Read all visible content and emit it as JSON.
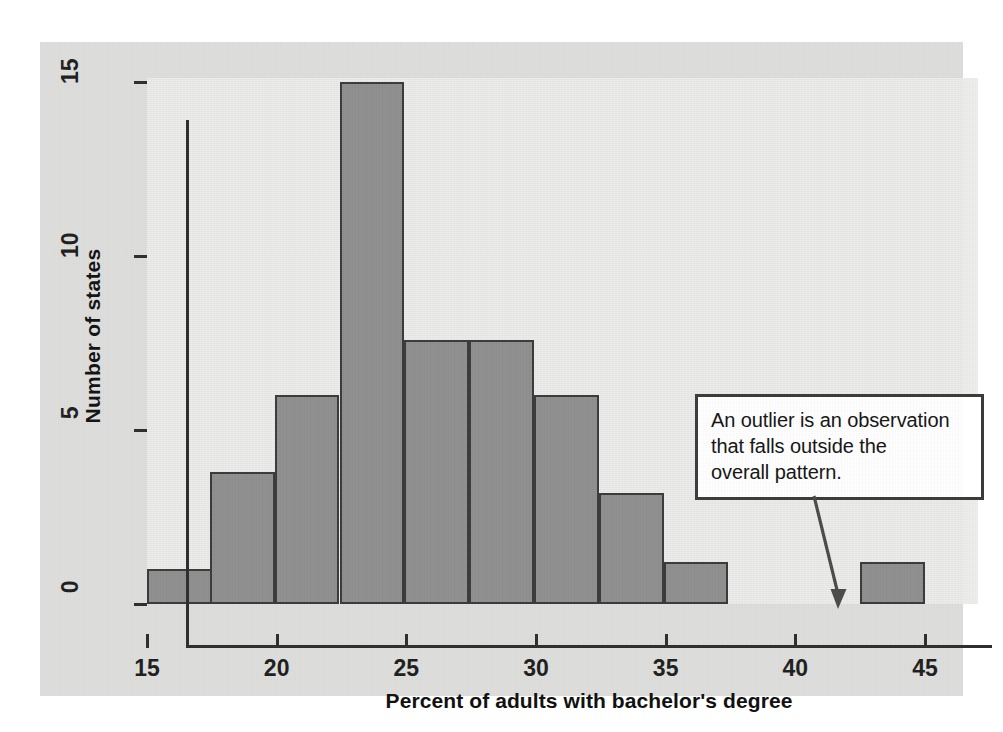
{
  "figure": {
    "panel_bg": "#dededc",
    "plot_bg": "#ededeb",
    "bar_fill": "#8f8f8f",
    "bar_stroke": "#3a3a3a",
    "axis_color": "#2e2e2e"
  },
  "annotation": {
    "line1": "An outlier is an observation",
    "line2": "that falls outside the",
    "line3": "overall pattern.",
    "full_text": "An outlier is an observation that falls outside the overall pattern."
  },
  "chart_data": {
    "type": "bar",
    "title": "",
    "xlabel": "Percent of adults with bachelor's degree",
    "ylabel": "Number of states",
    "xlim": [
      15,
      46.5
    ],
    "ylim": [
      0,
      15
    ],
    "grid": false,
    "legend": null,
    "bin_width": 2.5,
    "x_ticks": [
      15,
      20,
      25,
      30,
      35,
      40,
      45
    ],
    "x_tick_labels": [
      "15",
      "20",
      "25",
      "30",
      "35",
      "40",
      "45"
    ],
    "y_ticks": [
      0,
      5,
      10,
      15
    ],
    "y_tick_labels": [
      "0",
      "5",
      "10",
      "15"
    ],
    "bins": [
      {
        "start": 15.0,
        "end": 17.5,
        "value": 1
      },
      {
        "start": 17.5,
        "end": 20.0,
        "value": 3.8
      },
      {
        "start": 20.0,
        "end": 22.5,
        "value": 6
      },
      {
        "start": 22.5,
        "end": 25.0,
        "value": 15
      },
      {
        "start": 25.0,
        "end": 27.5,
        "value": 7.6
      },
      {
        "start": 27.5,
        "end": 30.0,
        "value": 7.6
      },
      {
        "start": 30.0,
        "end": 32.5,
        "value": 6
      },
      {
        "start": 32.5,
        "end": 35.0,
        "value": 3.2
      },
      {
        "start": 35.0,
        "end": 37.5,
        "value": 1.2
      },
      {
        "start": 37.5,
        "end": 40.0,
        "value": 0
      },
      {
        "start": 40.0,
        "end": 42.5,
        "value": 0
      },
      {
        "start": 42.5,
        "end": 45.0,
        "value": 1.2
      }
    ],
    "categories": [
      "15-17.5",
      "17.5-20",
      "20-22.5",
      "22.5-25",
      "25-27.5",
      "27.5-30",
      "30-32.5",
      "32.5-35",
      "35-37.5",
      "37.5-40",
      "40-42.5",
      "42.5-45"
    ],
    "values": [
      1,
      3.8,
      6,
      15,
      7.6,
      7.6,
      6,
      3.2,
      1.2,
      0,
      0,
      1.2
    ],
    "annotations": [
      {
        "text": "An outlier is an observation that falls outside the overall pattern.",
        "points_to_bin": "42.5-45"
      }
    ]
  }
}
